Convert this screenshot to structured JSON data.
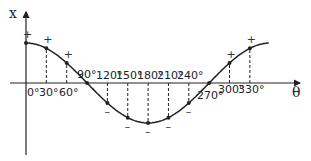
{
  "diagram": {
    "y_axis_label": "x",
    "x_axis_label": "θ",
    "angle_labels": [
      "0°",
      "30°",
      "60°",
      "90°",
      "120°",
      "150°",
      "180°",
      "210°",
      "240°",
      "270°",
      "300°",
      "330°"
    ],
    "signs": {
      "positive": "+",
      "negative": "–"
    },
    "points": [
      {
        "angle": 0,
        "sign": "+"
      },
      {
        "angle": 30,
        "sign": "+"
      },
      {
        "angle": 60,
        "sign": "+"
      },
      {
        "angle": 90,
        "sign": ""
      },
      {
        "angle": 120,
        "sign": "–"
      },
      {
        "angle": 150,
        "sign": "–"
      },
      {
        "angle": 180,
        "sign": "–"
      },
      {
        "angle": 210,
        "sign": "–"
      },
      {
        "angle": 240,
        "sign": "–"
      },
      {
        "angle": 270,
        "sign": ""
      },
      {
        "angle": 300,
        "sign": "+"
      },
      {
        "angle": 330,
        "sign": "+"
      }
    ],
    "curve": "cosine",
    "line_color": "#222222"
  }
}
